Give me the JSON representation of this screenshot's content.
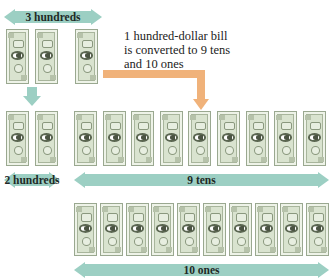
{
  "diagram": {
    "top_label": "3 hundreds",
    "caption_lines": [
      "1 hundred-dollar bill",
      "is converted to 9 tens",
      "and 10 ones"
    ],
    "hundreds_label": "2 hundreds",
    "tens_label": "9 tens",
    "ones_label": "10 ones",
    "counts": {
      "initial_hundreds": 3,
      "remaining_hundreds": 2,
      "tens": 9,
      "ones": 10
    },
    "colors": {
      "arrow_teal": "#9ccfc3",
      "arrow_orange": "#f0b27a",
      "bill_green": "#d9e3cf"
    }
  }
}
